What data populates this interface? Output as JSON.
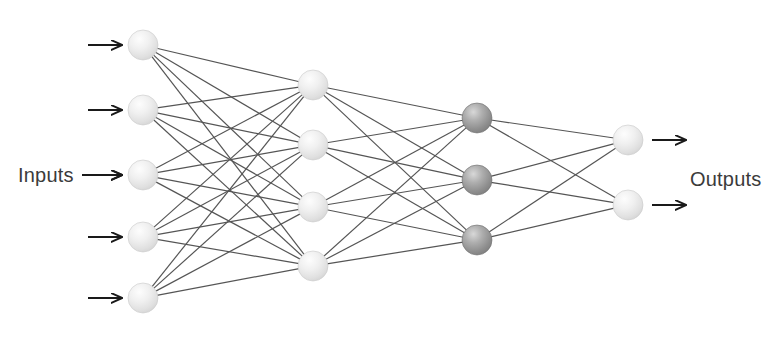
{
  "diagram": {
    "type": "neural-network",
    "background_color": "#ffffff",
    "edge_color": "#555555",
    "edge_width": 1.2,
    "arrow_color": "#1a1a1a",
    "labels": {
      "inputs": "Inputs",
      "outputs": "Outputs"
    },
    "label_color": "#3b3b3b",
    "node_radius": 15,
    "node_colors": {
      "light": "#e6e6e6",
      "light_highlight": "#fafafa",
      "light_edge": "#c9c9c9",
      "dark": "#8f8f8f",
      "dark_highlight": "#cfcfcf",
      "dark_edge": "#6f6f6f"
    },
    "layers": [
      {
        "name": "input-layer",
        "node_count": 5,
        "shade": "light",
        "x": 143,
        "node_y": [
          45,
          110,
          175,
          237,
          298
        ]
      },
      {
        "name": "hidden-layer-1",
        "node_count": 4,
        "shade": "light",
        "x": 313,
        "node_y": [
          85,
          145,
          207,
          266
        ]
      },
      {
        "name": "hidden-layer-2",
        "node_count": 3,
        "shade": "dark",
        "x": 477,
        "node_y": [
          118,
          180,
          240
        ]
      },
      {
        "name": "output-layer",
        "node_count": 2,
        "shade": "light",
        "x": 628,
        "node_y": [
          140,
          205
        ]
      }
    ],
    "connections": [
      {
        "from_layer": 0,
        "to_layer": 1,
        "fully_connected": true,
        "edge_count": 20
      },
      {
        "from_layer": 1,
        "to_layer": 2,
        "fully_connected": true,
        "edge_count": 12
      },
      {
        "from_layer": 2,
        "to_layer": 3,
        "fully_connected": true,
        "edge_count": 6
      }
    ],
    "input_arrows": [
      {
        "x1": 88,
        "x2": 122,
        "y": 45
      },
      {
        "x1": 88,
        "x2": 122,
        "y": 110
      },
      {
        "x1": 88,
        "x2": 122,
        "y": 175
      },
      {
        "x1": 88,
        "x2": 122,
        "y": 237
      },
      {
        "x1": 88,
        "x2": 122,
        "y": 298
      }
    ],
    "output_arrows": [
      {
        "x1": 652,
        "x2": 686,
        "y": 140
      },
      {
        "x1": 652,
        "x2": 686,
        "y": 205
      }
    ],
    "inputs_label_arrow": {
      "x1": 82,
      "x2": 122,
      "y": 175
    },
    "inputs_label_pos": {
      "x": 18,
      "y": 182
    },
    "outputs_label_pos": {
      "x": 690,
      "y": 186
    }
  }
}
